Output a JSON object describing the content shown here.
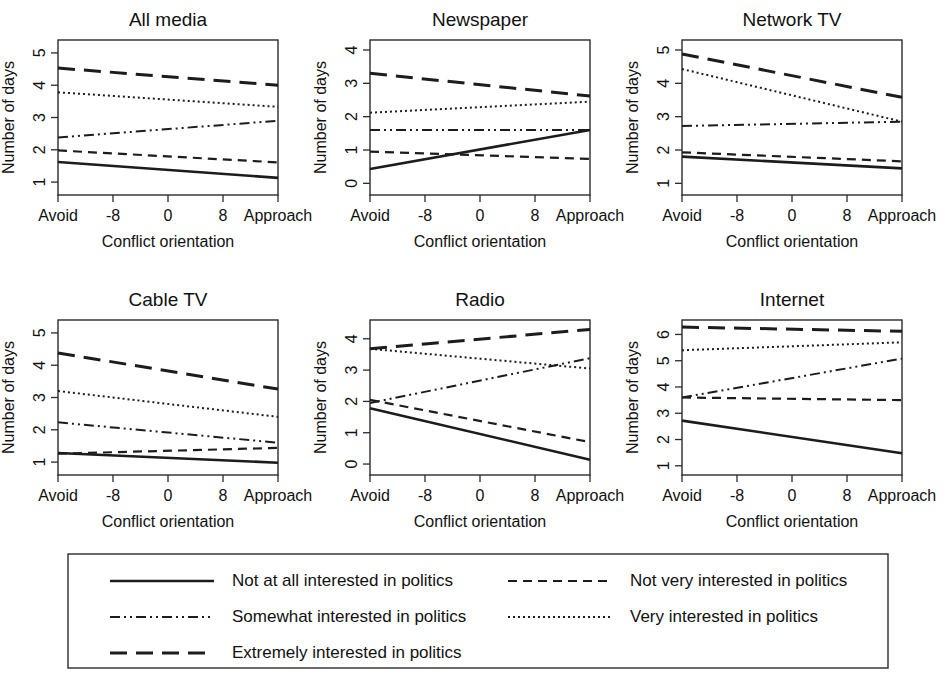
{
  "figure": {
    "width": 947,
    "height": 675,
    "background": "#ffffff",
    "line_color": "#1c1c1c",
    "frame_color": "#2b2b2b"
  },
  "axis_titles": {
    "x": "Conflict orientation",
    "y": "Number of days"
  },
  "x_axis": {
    "ticks": [
      -16,
      -8,
      0,
      8,
      16
    ],
    "tick_labels": [
      "Avoid",
      "-8",
      "0",
      "8",
      "Approach"
    ],
    "min": -16,
    "max": 16
  },
  "series_styles": {
    "not_at_all": {
      "dash": "none",
      "width": 2.6
    },
    "not_very": {
      "dash": "9,6",
      "width": 2.2
    },
    "somewhat": {
      "dash": "10,4,2,4,2,4",
      "width": 2.0
    },
    "very": {
      "dash": "2,3",
      "width": 2.0
    },
    "extremely": {
      "dash": "17,9",
      "width": 3.0
    }
  },
  "legend": {
    "entries": [
      {
        "key": "not_at_all",
        "label": "Not at all interested in politics",
        "column": 0,
        "row": 0
      },
      {
        "key": "not_very",
        "label": "Not very interested in politics",
        "column": 1,
        "row": 0
      },
      {
        "key": "somewhat",
        "label": "Somewhat interested in politics",
        "column": 0,
        "row": 1
      },
      {
        "key": "very",
        "label": "Very interested in politics",
        "column": 1,
        "row": 1
      },
      {
        "key": "extremely",
        "label": "Extremely interested in politics",
        "column": 0,
        "row": 2
      }
    ]
  },
  "chart_data": {
    "type": "line",
    "xlabel": "Conflict orientation",
    "ylabel": "Number of days",
    "x": [
      -16,
      16
    ],
    "x_tick_labels": [
      "Avoid",
      "-8",
      "0",
      "8",
      "Approach"
    ],
    "grid": false,
    "legend_position": "bottom",
    "panels": [
      {
        "title": "All media",
        "row": 0,
        "col": 0,
        "ylim": [
          0.6,
          5.4
        ],
        "yticks": [
          1,
          2,
          3,
          4,
          5
        ],
        "series": [
          {
            "name": "Not at all interested in politics",
            "key": "not_at_all",
            "values": [
              1.62,
              1.13
            ]
          },
          {
            "name": "Not very interested in politics",
            "key": "not_very",
            "values": [
              1.98,
              1.61
            ]
          },
          {
            "name": "Somewhat interested in politics",
            "key": "somewhat",
            "values": [
              2.38,
              2.9
            ]
          },
          {
            "name": "Very interested in politics",
            "key": "very",
            "values": [
              3.78,
              3.33
            ]
          },
          {
            "name": "Extremely interested in politics",
            "key": "extremely",
            "values": [
              4.53,
              4.0
            ]
          }
        ]
      },
      {
        "title": "Newspaper",
        "row": 0,
        "col": 1,
        "ylim": [
          -0.35,
          4.3
        ],
        "yticks": [
          0,
          1,
          2,
          3,
          4
        ],
        "series": [
          {
            "name": "Not at all interested in politics",
            "key": "not_at_all",
            "values": [
              0.43,
              1.6
            ]
          },
          {
            "name": "Not very interested in politics",
            "key": "not_very",
            "values": [
              0.95,
              0.73
            ]
          },
          {
            "name": "Somewhat interested in politics",
            "key": "somewhat",
            "values": [
              1.6,
              1.6
            ]
          },
          {
            "name": "Very interested in politics",
            "key": "very",
            "values": [
              2.12,
              2.45
            ]
          },
          {
            "name": "Extremely interested in politics",
            "key": "extremely",
            "values": [
              3.3,
              2.62
            ]
          }
        ]
      },
      {
        "title": "Network TV",
        "row": 0,
        "col": 2,
        "ylim": [
          0.65,
          5.3
        ],
        "yticks": [
          1,
          2,
          3,
          4,
          5
        ],
        "series": [
          {
            "name": "Not at all interested in politics",
            "key": "not_at_all",
            "values": [
              1.8,
              1.45
            ]
          },
          {
            "name": "Not very interested in politics",
            "key": "not_very",
            "values": [
              1.93,
              1.66
            ]
          },
          {
            "name": "Somewhat interested in politics",
            "key": "somewhat",
            "values": [
              2.72,
              2.85
            ]
          },
          {
            "name": "Very interested in politics",
            "key": "very",
            "values": [
              4.43,
              2.85
            ]
          },
          {
            "name": "Extremely interested in politics",
            "key": "extremely",
            "values": [
              4.88,
              3.58
            ]
          }
        ]
      },
      {
        "title": "Cable TV",
        "row": 1,
        "col": 0,
        "ylim": [
          0.6,
          5.4
        ],
        "yticks": [
          1,
          2,
          3,
          4,
          5
        ],
        "series": [
          {
            "name": "Not at all interested in politics",
            "key": "not_at_all",
            "values": [
              1.28,
              0.98
            ]
          },
          {
            "name": "Not very interested in politics",
            "key": "not_very",
            "values": [
              1.26,
              1.44
            ]
          },
          {
            "name": "Somewhat interested in politics",
            "key": "somewhat",
            "values": [
              2.23,
              1.6
            ]
          },
          {
            "name": "Very interested in politics",
            "key": "very",
            "values": [
              3.2,
              2.4
            ]
          },
          {
            "name": "Extremely interested in politics",
            "key": "extremely",
            "values": [
              4.38,
              3.26
            ]
          }
        ]
      },
      {
        "title": "Radio",
        "row": 1,
        "col": 1,
        "ylim": [
          -0.35,
          4.6
        ],
        "yticks": [
          0,
          1,
          2,
          3,
          4
        ],
        "series": [
          {
            "name": "Not at all interested in politics",
            "key": "not_at_all",
            "values": [
              1.78,
              0.14
            ]
          },
          {
            "name": "Not very interested in politics",
            "key": "not_very",
            "values": [
              2.05,
              0.7
            ]
          },
          {
            "name": "Somewhat interested in politics",
            "key": "somewhat",
            "values": [
              1.95,
              3.38
            ]
          },
          {
            "name": "Very interested in politics",
            "key": "very",
            "values": [
              3.68,
              3.05
            ]
          },
          {
            "name": "Extremely interested in politics",
            "key": "extremely",
            "values": [
              3.68,
              4.3
            ]
          }
        ]
      },
      {
        "title": "Internet",
        "row": 1,
        "col": 2,
        "ylim": [
          0.65,
          6.55
        ],
        "yticks": [
          1,
          2,
          3,
          4,
          5,
          6
        ],
        "series": [
          {
            "name": "Not at all interested in politics",
            "key": "not_at_all",
            "values": [
              2.72,
              1.48
            ]
          },
          {
            "name": "Not very interested in politics",
            "key": "not_very",
            "values": [
              3.6,
              3.5
            ]
          },
          {
            "name": "Somewhat interested in politics",
            "key": "somewhat",
            "values": [
              3.6,
              5.08
            ]
          },
          {
            "name": "Very interested in politics",
            "key": "very",
            "values": [
              5.4,
              5.7
            ]
          },
          {
            "name": "Extremely interested in politics",
            "key": "extremely",
            "values": [
              6.28,
              6.12
            ]
          }
        ]
      }
    ]
  }
}
